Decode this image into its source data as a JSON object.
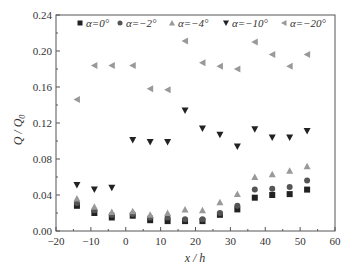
{
  "chart_data": {
    "type": "scatter",
    "title": "",
    "xlabel": "x / h",
    "ylabel": "Q / Q0",
    "xlim": [
      -20,
      60
    ],
    "ylim": [
      0,
      0.24
    ],
    "xticks": [
      -20,
      -10,
      0,
      10,
      20,
      30,
      40,
      50,
      60
    ],
    "yticks": [
      0.0,
      0.04,
      0.08,
      0.12,
      0.16,
      0.2,
      0.24
    ],
    "xtick_labels": [
      "−20",
      "−10",
      "0",
      "10",
      "20",
      "30",
      "40",
      "50",
      "60"
    ],
    "ytick_labels": [
      "0.00",
      "0.04",
      "0.08",
      "0.12",
      "0.16",
      "0.20",
      "0.24"
    ],
    "grid": false,
    "legend_position": "top, inside plot, single row",
    "x": [
      -14,
      -9,
      -4,
      2,
      7,
      12,
      17,
      22,
      27,
      32,
      37,
      42,
      47,
      52
    ],
    "series": [
      {
        "name": "α=0°",
        "marker": "square",
        "color": "#222222",
        "values": [
          0.028,
          0.02,
          0.015,
          0.017,
          0.012,
          0.011,
          0.011,
          0.011,
          0.018,
          0.024,
          0.037,
          0.04,
          0.041,
          0.046
        ]
      },
      {
        "name": "α=−2°",
        "marker": "circle",
        "color": "#555555",
        "values": [
          0.031,
          0.023,
          0.018,
          0.019,
          0.015,
          0.015,
          0.013,
          0.013,
          0.02,
          0.028,
          0.046,
          0.047,
          0.049,
          0.056
        ]
      },
      {
        "name": "α=−4°",
        "marker": "triangle-up",
        "color": "#999999",
        "values": [
          0.036,
          0.027,
          0.021,
          0.022,
          0.018,
          0.02,
          0.024,
          0.023,
          0.032,
          0.041,
          0.06,
          0.063,
          0.067,
          0.072
        ]
      },
      {
        "name": "α=−10°",
        "marker": "triangle-down",
        "color": "#222222",
        "values": [
          0.051,
          0.046,
          0.048,
          0.101,
          0.099,
          0.099,
          0.134,
          0.114,
          0.107,
          0.094,
          0.113,
          0.104,
          0.104,
          0.111
        ]
      },
      {
        "name": "α=−20°",
        "marker": "triangle-left",
        "color": "#999999",
        "values": [
          0.146,
          0.184,
          0.184,
          0.184,
          0.158,
          0.157,
          0.211,
          0.187,
          0.183,
          0.18,
          0.21,
          0.196,
          0.183,
          0.196
        ]
      }
    ]
  },
  "labels": {
    "xlabel": "x / h",
    "ylabel_main": "Q / Q",
    "ylabel_sub": "0"
  }
}
